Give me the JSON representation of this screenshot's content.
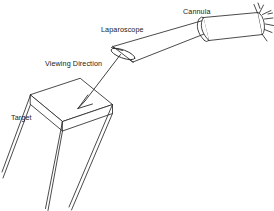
{
  "figure": {
    "stroke_color": "#2b2b2b",
    "fill_color": "#ffffff",
    "background": "#ffffff",
    "width": 274,
    "height": 211
  },
  "labels": {
    "cannula": "Cannula",
    "laparoscope": "Laparoscope",
    "viewing_direction": "Viewing Direction",
    "target": "Target"
  },
  "parts": {
    "cannula_name": "cannula-tube",
    "cannula_flange_name": "cannula-flange-spikes",
    "scope_name": "laparoscope-shaft",
    "scope_tip_name": "laparoscope-beveled-lens-tip",
    "arrow_name": "viewing-direction-arrow",
    "target_name": "target-box"
  }
}
